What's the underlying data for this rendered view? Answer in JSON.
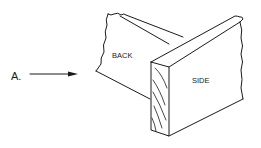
{
  "diagram": {
    "type": "woodworking-joint-isometric",
    "pointer_label": "A.",
    "parts": [
      {
        "id": "back",
        "label": "BACK"
      },
      {
        "id": "side",
        "label": "SIDE"
      }
    ],
    "colors": {
      "line": "#1a1a1a",
      "background": "#ffffff"
    }
  }
}
